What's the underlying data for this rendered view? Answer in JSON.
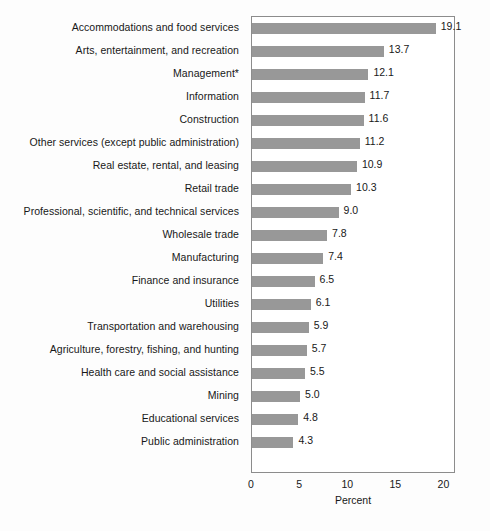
{
  "chart_data": {
    "type": "bar",
    "orientation": "horizontal",
    "title": "",
    "xlabel": "Percent",
    "ylabel": "",
    "xlim": [
      0,
      21.2
    ],
    "xticks": [
      0,
      5,
      10,
      15,
      20
    ],
    "grid": false,
    "legend": null,
    "bar_color": "#989898",
    "categories": [
      "Accommodations and food services",
      "Arts, entertainment, and recreation",
      "Management*",
      "Information",
      "Construction",
      "Other services (except public administration)",
      "Real estate, rental, and leasing",
      "Retail trade",
      "Professional, scientific, and technical services",
      "Wholesale trade",
      "Manufacturing",
      "Finance and insurance",
      "Utilities",
      "Transportation and warehousing",
      "Agriculture, forestry, fishing, and hunting",
      "Health care and social assistance",
      "Mining",
      "Educational services",
      "Public administration"
    ],
    "values": [
      19.1,
      13.7,
      12.1,
      11.7,
      11.6,
      11.2,
      10.9,
      10.3,
      9.0,
      7.8,
      7.4,
      6.5,
      6.1,
      5.9,
      5.7,
      5.5,
      5.0,
      4.8,
      4.3
    ],
    "value_labels": [
      "19.1",
      "13.7",
      "12.1",
      "11.7",
      "11.6",
      "11.2",
      "10.9",
      "10.3",
      "9.0",
      "7.8",
      "7.4",
      "6.5",
      "6.1",
      "5.9",
      "5.7",
      "5.5",
      "5.0",
      "4.8",
      "4.3"
    ],
    "xtick_labels": [
      "0",
      "5",
      "10",
      "15",
      "20"
    ]
  }
}
